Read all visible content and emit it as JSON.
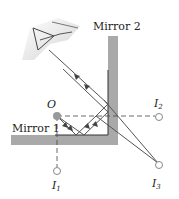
{
  "diagram": {
    "labels": {
      "mirror1": "Mirror 1",
      "mirror2": "Mirror 2",
      "object": "O",
      "image1_main": "I",
      "image1_sub": "1",
      "image2_main": "I",
      "image2_sub": "2",
      "image3_main": "I",
      "image3_sub": "3"
    },
    "colors": {
      "mirror": "#a9a9a9",
      "mirror_surface": "#333333",
      "ray": "#555555",
      "dashed": "#444444",
      "object_dot": "#999999",
      "image_circle": "#888888"
    }
  }
}
